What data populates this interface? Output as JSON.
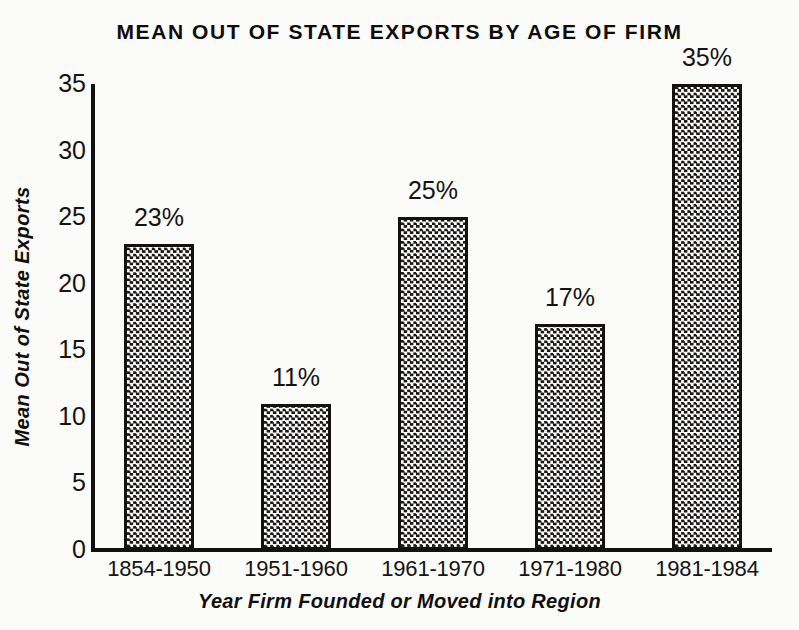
{
  "chart_data": {
    "type": "bar",
    "title": "MEAN OUT OF STATE EXPORTS BY AGE OF FIRM",
    "xlabel": "Year Firm Founded or Moved into Region",
    "ylabel": "Mean Out of State Exports",
    "categories": [
      "1854-1950",
      "1951-1960",
      "1961-1970",
      "1971-1980",
      "1981-1984"
    ],
    "values": [
      23,
      11,
      25,
      17,
      35
    ],
    "value_labels": [
      "23%",
      "11%",
      "25%",
      "17%",
      "35%"
    ],
    "ylim": [
      0,
      35
    ],
    "ytick_labels": [
      "0",
      "5",
      "10",
      "15",
      "20",
      "25",
      "30",
      "35"
    ],
    "ytick_values": [
      0,
      5,
      10,
      15,
      20,
      25,
      30,
      35
    ],
    "grid": false,
    "legend": "none",
    "bar_fill": "checkerboard-dot-pattern",
    "colors": {
      "background": "#fbfbfa",
      "axis": "#121110",
      "text": "#12100f",
      "bar_border": "#131211",
      "bar_pattern_dark": "#1a1817",
      "bar_pattern_light": "#ffffff"
    }
  }
}
